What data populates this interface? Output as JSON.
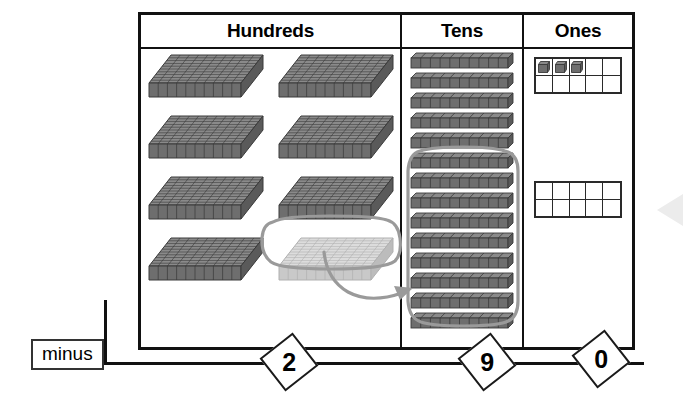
{
  "panel": {
    "columns": [
      {
        "id": "hundreds",
        "label": "Hundreds",
        "block_type": "flat",
        "block_count": 8,
        "rows": 4,
        "per_row": 2,
        "faded_index": 7,
        "value": 800
      },
      {
        "id": "tens",
        "label": "Tens",
        "block_type": "rod",
        "block_count": 14,
        "lassoed_from_index": 5,
        "lassoed_count": 9,
        "value": 140
      },
      {
        "id": "ones",
        "label": "Ones",
        "block_type": "unit",
        "frames": 2,
        "frame_columns": 5,
        "frame_rows": 2,
        "filled_cells": 3,
        "value": 3
      }
    ]
  },
  "operation": {
    "label": "minus",
    "digits": [
      {
        "place": "hundreds",
        "value": "2"
      },
      {
        "place": "tens",
        "value": "9"
      },
      {
        "place": "ones",
        "value": "0"
      }
    ]
  },
  "annotations": {
    "hundreds_lasso": "regroup-selection-hundreds",
    "tens_lasso": "subtract-selection-tens",
    "regroup_arrow": "regroup-arrow-hundreds-to-tens",
    "nav_arrow": "previous-step-arrow"
  },
  "colors": {
    "block_fill": "#6e6e6e",
    "block_stroke": "#3a3a3a",
    "block_faded_fill": "#c9c9c9",
    "lasso": "#9a9a9a",
    "border": "#111111",
    "nav_arrow": "#ececec"
  }
}
